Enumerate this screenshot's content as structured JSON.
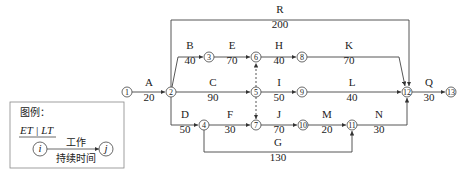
{
  "diagram": {
    "type": "activity-on-arrow network",
    "nodes": [
      {
        "id": "1",
        "x": 127,
        "y": 92
      },
      {
        "id": "2",
        "x": 171,
        "y": 92
      },
      {
        "id": "3",
        "x": 209,
        "y": 57
      },
      {
        "id": "4",
        "x": 204,
        "y": 125
      },
      {
        "id": "5",
        "x": 256,
        "y": 92
      },
      {
        "id": "6",
        "x": 256,
        "y": 57
      },
      {
        "id": "7",
        "x": 256,
        "y": 125
      },
      {
        "id": "8",
        "x": 302,
        "y": 57
      },
      {
        "id": "9",
        "x": 302,
        "y": 92
      },
      {
        "id": "10",
        "x": 303,
        "y": 125
      },
      {
        "id": "11",
        "x": 352,
        "y": 125
      },
      {
        "id": "12",
        "x": 407,
        "y": 92
      },
      {
        "id": "13",
        "x": 451,
        "y": 92
      }
    ],
    "activities": [
      {
        "name": "A",
        "duration": "20",
        "from": "1",
        "to": "2"
      },
      {
        "name": "B",
        "duration": "40",
        "from": "2",
        "to": "3"
      },
      {
        "name": "C",
        "duration": "90",
        "from": "2",
        "to": "5"
      },
      {
        "name": "D",
        "duration": "50",
        "from": "2",
        "to": "4"
      },
      {
        "name": "E",
        "duration": "70",
        "from": "3",
        "to": "6"
      },
      {
        "name": "F",
        "duration": "30",
        "from": "4",
        "to": "7"
      },
      {
        "name": "G",
        "duration": "130",
        "from": "4",
        "to": "11"
      },
      {
        "name": "H",
        "duration": "40",
        "from": "6",
        "to": "8"
      },
      {
        "name": "I",
        "duration": "50",
        "from": "5",
        "to": "9"
      },
      {
        "name": "J",
        "duration": "70",
        "from": "7",
        "to": "10"
      },
      {
        "name": "K",
        "duration": "70",
        "from": "8",
        "to": "12"
      },
      {
        "name": "L",
        "duration": "40",
        "from": "9",
        "to": "12"
      },
      {
        "name": "M",
        "duration": "20",
        "from": "10",
        "to": "11"
      },
      {
        "name": "N",
        "duration": "30",
        "from": "11",
        "to": "12"
      },
      {
        "name": "Q",
        "duration": "30",
        "from": "12",
        "to": "13"
      },
      {
        "name": "R",
        "duration": "200",
        "from": "2",
        "to": "12"
      }
    ],
    "dummies": [
      {
        "from": "5",
        "to": "6"
      },
      {
        "from": "5",
        "to": "7"
      }
    ]
  },
  "legend": {
    "title": "图例：",
    "header": "ET | LT",
    "node_i": "i",
    "node_j": "j",
    "work_label": "工作",
    "duration_label": "持续时间"
  }
}
